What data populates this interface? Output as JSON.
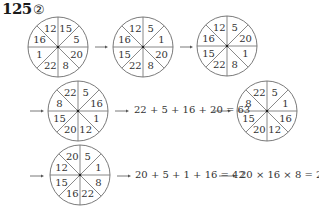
{
  "title": {
    "number": "125",
    "part": "②"
  },
  "colors": {
    "line": "#6b6b6b",
    "text": "#333333",
    "arrow": "#555555"
  },
  "wheels": [
    {
      "id": "wheel-1",
      "cx": 58,
      "cy": 47,
      "values": [
        "12",
        "15",
        "5",
        "20",
        "8",
        "22",
        "1",
        "16"
      ]
    },
    {
      "id": "wheel-2",
      "cx": 143,
      "cy": 47,
      "values": [
        "12",
        "5",
        "1",
        "20",
        "8",
        "22",
        "15",
        "16"
      ]
    },
    {
      "id": "wheel-3",
      "cx": 227,
      "cy": 46,
      "values": [
        "12",
        "5",
        "20",
        "1",
        "8",
        "22",
        "15",
        "16"
      ]
    },
    {
      "id": "wheel-4",
      "cx": 78,
      "cy": 111,
      "values": [
        "22",
        "5",
        "16",
        "1",
        "12",
        "20",
        "15",
        "8"
      ]
    },
    {
      "id": "wheel-5",
      "cx": 267,
      "cy": 111,
      "values": [
        "22",
        "5",
        "1",
        "16",
        "12",
        "20",
        "15",
        "8"
      ]
    },
    {
      "id": "wheel-6",
      "cx": 80,
      "cy": 175,
      "values": [
        "20",
        "5",
        "1",
        "8",
        "22",
        "16",
        "15",
        "12"
      ]
    }
  ],
  "equations": {
    "sum1": "22 + 5 + 16 + 20 = 63",
    "sum2": "20 + 5 + 1 + 16 = 42",
    "product": "20 × 16 × 8 = 2560"
  },
  "arrows": [
    {
      "x1": 95,
      "y1": 47,
      "x2": 108,
      "y2": 47
    },
    {
      "x1": 180,
      "y1": 47,
      "x2": 193,
      "y2": 47
    },
    {
      "x1": 30,
      "y1": 111,
      "x2": 44,
      "y2": 111
    },
    {
      "x1": 115,
      "y1": 111,
      "x2": 129,
      "y2": 111
    },
    {
      "x1": 213,
      "y1": 111,
      "x2": 231,
      "y2": 111
    },
    {
      "x1": 30,
      "y1": 176,
      "x2": 44,
      "y2": 176
    },
    {
      "x1": 117,
      "y1": 176,
      "x2": 131,
      "y2": 176
    },
    {
      "x1": 219,
      "y1": 176,
      "x2": 236,
      "y2": 176
    }
  ]
}
